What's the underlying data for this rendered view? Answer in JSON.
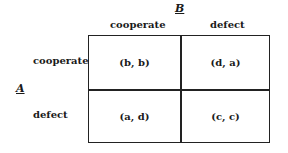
{
  "players": {
    "column": "B",
    "row": "A"
  },
  "columns": [
    "cooperate",
    "defect"
  ],
  "rows": [
    "cooperate",
    "defect"
  ],
  "payoffs": [
    [
      "(b, b)",
      "(d, a)"
    ],
    [
      "(a, d)",
      "(c, c)"
    ]
  ]
}
